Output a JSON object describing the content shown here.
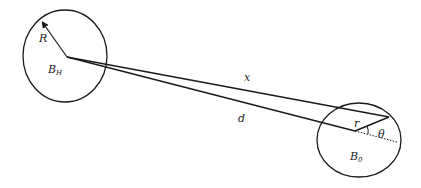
{
  "diagram": {
    "type": "geometry",
    "stroke_color": "#1a1a1a",
    "background": "#ffffff",
    "nodes": [
      {
        "id": "ball-H",
        "label": "B",
        "subscript": "H",
        "shape": "circle"
      },
      {
        "id": "ball-0",
        "label": "B",
        "subscript": "0",
        "shape": "circle"
      }
    ],
    "labels": {
      "radius": "R",
      "ball_H_main": "B",
      "ball_H_sub": "H",
      "line_x": "x",
      "line_d": "d",
      "small_r": "r",
      "angle": "θ",
      "ball_0_main": "B",
      "ball_0_sub": "0"
    },
    "edges": [
      {
        "from": "center-H",
        "to": "point-x",
        "label": "x"
      },
      {
        "from": "center-H",
        "to": "center-0",
        "label": "d"
      },
      {
        "from": "center-0",
        "to": "point-x",
        "label": "r"
      },
      {
        "from": "center-H",
        "to": "circle-H-boundary",
        "label": "R",
        "arrow": true
      },
      {
        "from": "center-0",
        "to": "extension",
        "style": "dotted"
      }
    ],
    "angle_marker": {
      "at": "center-0",
      "label": "θ"
    }
  }
}
